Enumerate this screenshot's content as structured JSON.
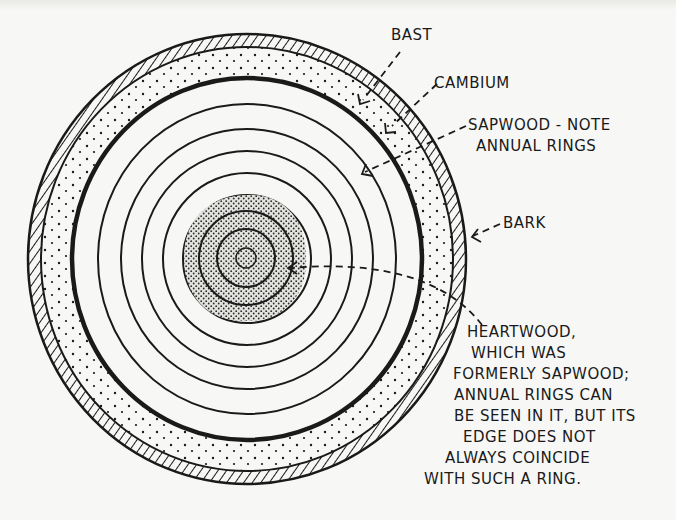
{
  "diagram": {
    "labels": {
      "bast": "BAST",
      "cambium": "CAMBIUM",
      "sapwood_line1": "SAPWOOD - NOTE",
      "sapwood_line2": "ANNUAL RINGS",
      "bark": "BARK",
      "heartwood_lines": [
        "HEARTWOOD,",
        "WHICH WAS",
        "FORMERLY SAPWOOD;",
        "ANNUAL RINGS CAN",
        "BE SEEN IN IT, BUT ITS",
        "EDGE DOES NOT",
        "ALWAYS COINCIDE",
        "WITH SUCH A RING."
      ]
    },
    "layers": [
      {
        "name": "bark",
        "fill": "hatched"
      },
      {
        "name": "bast",
        "fill": "dotted"
      },
      {
        "name": "cambium",
        "fill": "thick line"
      },
      {
        "name": "sapwood",
        "fill": "annual rings"
      },
      {
        "name": "heartwood",
        "fill": "stippled"
      }
    ],
    "colors": {
      "ink": "#1a1a1a",
      "paper": "#f7f7f5"
    }
  }
}
